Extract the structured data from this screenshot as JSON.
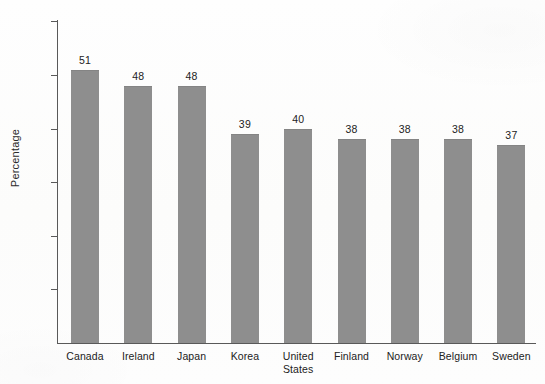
{
  "chart_data": {
    "type": "bar",
    "title": "",
    "xlabel": "",
    "ylabel": "Percentage",
    "categories": [
      "Canada",
      "Ireland",
      "Japan",
      "Korea",
      "United States",
      "Finland",
      "Norway",
      "Belgium",
      "Sweden"
    ],
    "values": [
      51,
      48,
      48,
      39,
      40,
      38,
      38,
      38,
      37
    ],
    "data_labels": [
      "51",
      "48",
      "48",
      "39",
      "40",
      "38",
      "38",
      "38",
      "37"
    ],
    "ylim": [
      0,
      63
    ],
    "yticks": [
      10,
      20,
      30,
      40,
      50,
      60
    ],
    "ytick_labels": [
      "10",
      "20",
      "30",
      "40",
      "50",
      "60"
    ],
    "grid": false,
    "legend": false,
    "bar_color": "#8e8e8e",
    "axis_color": "#595959",
    "text_color": "#222222"
  },
  "axis": {
    "y_title": "Percentage"
  }
}
